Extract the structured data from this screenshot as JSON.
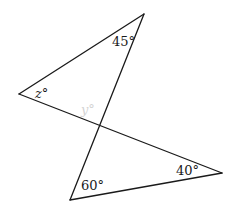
{
  "diagram": {
    "type": "two-triangles-vertical-angles",
    "points": {
      "top": {
        "x": 144,
        "y": 14
      },
      "left": {
        "x": 19,
        "y": 94
      },
      "intersection": {
        "x": 100,
        "y": 126
      },
      "bottom": {
        "x": 70,
        "y": 200
      },
      "right": {
        "x": 222,
        "y": 173
      }
    },
    "segments": [
      {
        "name": "top-to-left",
        "from": "top",
        "to": "left"
      },
      {
        "name": "top-to-bottom",
        "from": "top",
        "to": "bottom"
      },
      {
        "name": "left-to-right",
        "from": "left",
        "to": "right"
      },
      {
        "name": "bottom-to-right",
        "from": "bottom",
        "to": "right"
      }
    ],
    "labels": {
      "angle_top": "45°",
      "angle_left": "z°",
      "angle_bottom": "60°",
      "angle_right": "40°",
      "angle_faint": "y°"
    },
    "colors": {
      "line": "#1a1a1a",
      "text": "#1a1a1a",
      "faint": "#d4d4d4",
      "background": "#ffffff"
    }
  }
}
